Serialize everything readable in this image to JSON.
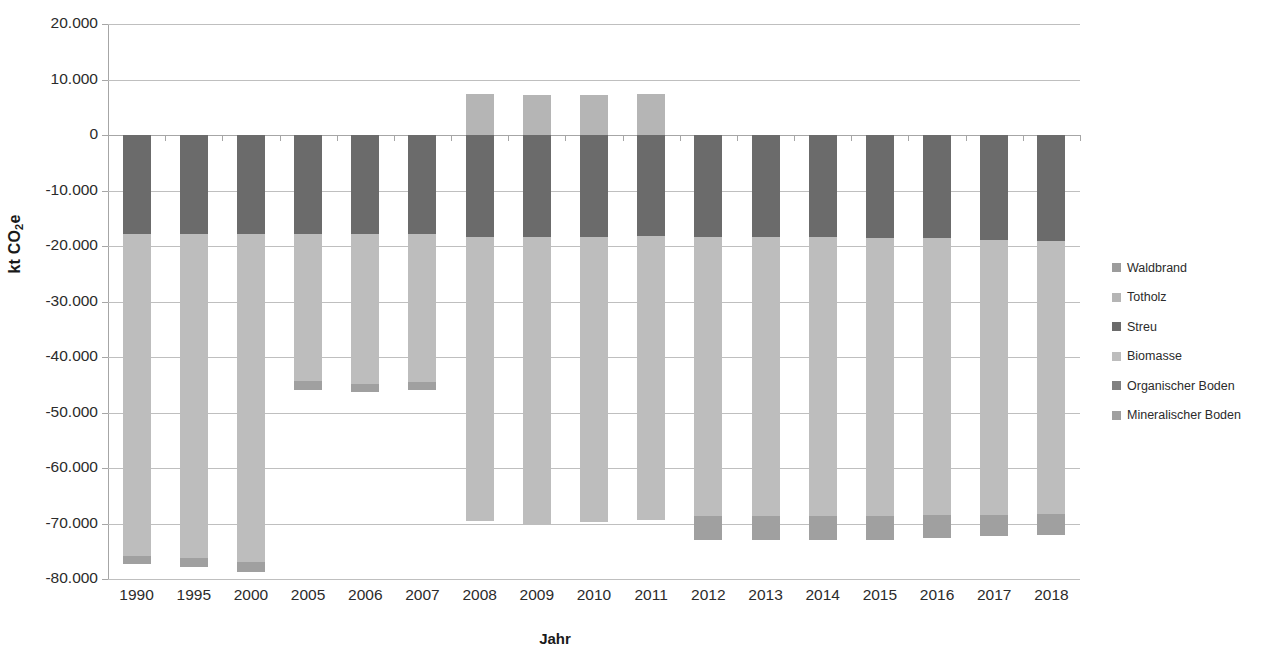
{
  "chart_data": {
    "type": "bar",
    "stacked": true,
    "title": "",
    "xlabel": "Jahr",
    "ylabel": "kt CO2e",
    "ylabel_parts": {
      "pre": "kt CO",
      "sub": "2",
      "post": "e"
    },
    "ylim": [
      -80000,
      20000
    ],
    "ytick_step": 10000,
    "ytick_labels": [
      "20.000",
      "10.000",
      "0",
      "-10.000",
      "-20.000",
      "-30.000",
      "-40.000",
      "-50.000",
      "-60.000",
      "-70.000",
      "-80.000"
    ],
    "ytick_values": [
      20000,
      10000,
      0,
      -10000,
      -20000,
      -30000,
      -40000,
      -50000,
      -60000,
      -70000,
      -80000
    ],
    "grid": true,
    "legend_position": "right",
    "categories": [
      "1990",
      "1995",
      "2000",
      "2005",
      "2006",
      "2007",
      "2008",
      "2009",
      "2010",
      "2011",
      "2012",
      "2013",
      "2014",
      "2015",
      "2016",
      "2017",
      "2018"
    ],
    "series": [
      {
        "name": "Waldbrand",
        "color": "#9c9c9c",
        "values": [
          0,
          0,
          0,
          0,
          0,
          0,
          0,
          0,
          0,
          0,
          0,
          0,
          0,
          0,
          0,
          0,
          0
        ]
      },
      {
        "name": "Totholz",
        "color": "#b5b5b5",
        "values": [
          0,
          0,
          0,
          0,
          0,
          0,
          7300,
          7200,
          7200,
          7400,
          0,
          0,
          0,
          0,
          0,
          0,
          0
        ]
      },
      {
        "name": "Streu",
        "color": "#6b6b6b",
        "values": [
          -17900,
          -17900,
          -17900,
          -17900,
          -17900,
          -17900,
          -18300,
          -18300,
          -18300,
          -18200,
          -18300,
          -18400,
          -18400,
          -18500,
          -18600,
          -19000,
          -19100
        ]
      },
      {
        "name": "Biomasse",
        "color": "#bdbdbd",
        "values": [
          -57900,
          -58400,
          -59100,
          -26500,
          -26900,
          -26600,
          -51200,
          -51900,
          -51500,
          -51100,
          -50400,
          -50300,
          -50300,
          -50200,
          -49900,
          -49400,
          -49200
        ]
      },
      {
        "name": "Organischer Boden",
        "color": "#808080",
        "values": [
          0,
          0,
          0,
          0,
          0,
          0,
          0,
          0,
          0,
          0,
          0,
          0,
          0,
          0,
          0,
          0,
          0
        ]
      },
      {
        "name": "Mineralischer Boden",
        "color": "#a0a0a0",
        "values": [
          -1500,
          -1600,
          -1700,
          -1500,
          -1500,
          -1500,
          0,
          0,
          0,
          0,
          -4300,
          -4200,
          -4200,
          -4300,
          -4200,
          -3900,
          -3700
        ]
      }
    ],
    "bar_totals_positive": [
      3000,
      3000,
      3000,
      3000,
      3000,
      3000,
      10500,
      10400,
      10400,
      10600,
      3200,
      3300,
      3400,
      3500,
      3600,
      3800,
      3900
    ],
    "bar_totals_negative": [
      -73500,
      -74000,
      -74700,
      -43200,
      -43500,
      -43300,
      -66300,
      -67000,
      -66700,
      -66100,
      -69800,
      -69700,
      -69600,
      -69600,
      -69300,
      -69000,
      -68900
    ]
  },
  "legend": {
    "items": [
      {
        "label": "Waldbrand",
        "color": "#9c9c9c"
      },
      {
        "label": "Totholz",
        "color": "#b5b5b5"
      },
      {
        "label": "Streu",
        "color": "#6b6b6b"
      },
      {
        "label": "Biomasse",
        "color": "#bdbdbd"
      },
      {
        "label": "Organischer Boden",
        "color": "#808080"
      },
      {
        "label": "Mineralischer Boden",
        "color": "#a0a0a0"
      }
    ]
  },
  "axes": {
    "x_title": "Jahr",
    "y_title_pre": "kt CO",
    "y_title_sub": "2",
    "y_title_post": "e"
  }
}
